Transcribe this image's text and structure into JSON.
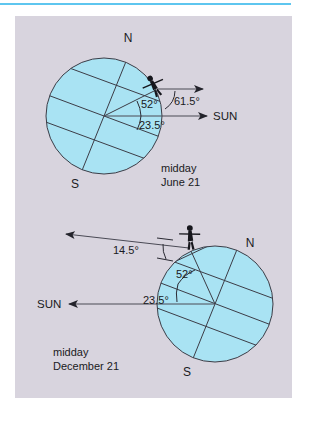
{
  "figure": {
    "background_color": "#d8d4de",
    "globe_color": "#a8e2f2",
    "rule_color": "#5ec6ef",
    "line_color": "#2a2a33",
    "panels": [
      {
        "id": "june",
        "caption_line1": "midday",
        "caption_line2": "June 21",
        "pole_north_label": "N",
        "pole_south_label": "S",
        "sun_label": "SUN",
        "angles": {
          "horizon": "61.5°",
          "latitude": "52°",
          "tilt": "23.5°"
        }
      },
      {
        "id": "december",
        "caption_line1": "midday",
        "caption_line2": "December 21",
        "pole_north_label": "N",
        "pole_south_label": "S",
        "sun_label": "SUN",
        "angles": {
          "horizon": "14.5°",
          "latitude": "52°",
          "tilt": "23.5°"
        }
      }
    ],
    "icons": {
      "observer": "person-icon",
      "sun_arrow": "arrow-icon",
      "horizon_arrow": "arrow-icon"
    }
  }
}
